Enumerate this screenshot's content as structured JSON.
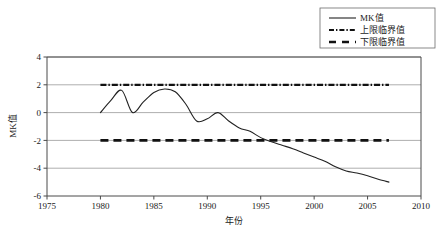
{
  "chart_data": {
    "type": "line",
    "title": "",
    "xlabel": "年份",
    "ylabel": "MK值",
    "xlim": [
      1975,
      2010
    ],
    "ylim": [
      -6,
      4
    ],
    "xticks": [
      1975,
      1980,
      1985,
      1990,
      1995,
      2000,
      2005,
      2010
    ],
    "yticks": [
      4,
      2,
      0,
      -2,
      -4,
      -6
    ],
    "grid": true,
    "legend_position": "top-right",
    "series": [
      {
        "name": "MK值",
        "style": "solid",
        "x": [
          1980,
          1981,
          1982,
          1983,
          1984,
          1985,
          1986,
          1987,
          1988,
          1989,
          1990,
          1991,
          1992,
          1993,
          1994,
          1995,
          1996,
          1997,
          1998,
          1999,
          2000,
          2001,
          2002,
          2003,
          2004,
          2005,
          2006,
          2007
        ],
        "values": [
          0.0,
          0.9,
          1.6,
          0.0,
          0.75,
          1.45,
          1.7,
          1.5,
          0.6,
          -0.6,
          -0.45,
          0.0,
          -0.6,
          -1.1,
          -1.35,
          -1.8,
          -2.1,
          -2.35,
          -2.6,
          -2.9,
          -3.2,
          -3.5,
          -3.9,
          -4.2,
          -4.35,
          -4.55,
          -4.8,
          -5.0
        ]
      },
      {
        "name": "上限临界值",
        "style": "dash-dot",
        "constant": 2,
        "x_start": 1980,
        "x_end": 2007
      },
      {
        "name": "下限临界值",
        "style": "dashed",
        "constant": -2,
        "x_start": 1980,
        "x_end": 2007
      }
    ],
    "legend_entries": [
      {
        "label": "MK值",
        "style": "solid"
      },
      {
        "label": "上限临界值",
        "style": "dash-dot"
      },
      {
        "label": "下限临界值",
        "style": "dashed"
      }
    ]
  },
  "axis": {
    "y_title": "MK值",
    "x_title": "年份",
    "x_tick_labels": [
      "1975",
      "1980",
      "1985",
      "1990",
      "1995",
      "2000",
      "2005",
      "2010"
    ],
    "y_tick_labels": [
      "4",
      "2",
      "0",
      "-2",
      "-4",
      "-6"
    ]
  },
  "legend": {
    "items": [
      {
        "label": "MK值"
      },
      {
        "label": "上限临界值"
      },
      {
        "label": "下限临界值"
      }
    ]
  },
  "colors": {
    "series": "#222222",
    "threshold": "#111111",
    "grid": "#8c8c8c",
    "axis": "#4a4a4a",
    "background": "#ffffff"
  }
}
